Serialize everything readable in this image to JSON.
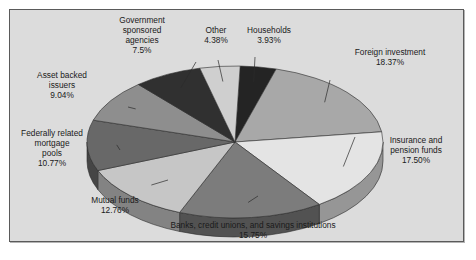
{
  "figure": {
    "background_color": "#ffffff",
    "frame_color": "#dcdcdc",
    "frame_border_color": "#5a5a5a"
  },
  "chart_data": {
    "type": "pie",
    "title": "",
    "subtitle": "",
    "xlabel": "",
    "ylabel": "",
    "grid": false,
    "legend_position": "none",
    "label_format": "name + percent",
    "three_d": true,
    "total_percent": "100.00%",
    "categories": [
      "Households",
      "Foreign investment",
      "Insurance and pension funds",
      "Banks, credit unions, and savings institutions",
      "Mutual funds",
      "Federally related mortgage pools",
      "Asset backed issuers",
      "Government sponsored agencies",
      "Other"
    ],
    "values": [
      3.93,
      18.37,
      17.5,
      15.75,
      12.76,
      10.77,
      9.04,
      7.5,
      4.38
    ],
    "value_labels": [
      "3.93%",
      "18.37%",
      "17.50%",
      "15.75%",
      "12.76%",
      "10.77%",
      "9.04%",
      "7.5%",
      "4.38%"
    ],
    "colors": [
      "#242424",
      "#a8a8a8",
      "#e4e4e4",
      "#7c7c7c",
      "#c6c6c6",
      "#686868",
      "#8e8e8e",
      "#303030",
      "#cfcfcf"
    ],
    "slices": [
      {
        "name": "Households",
        "value": 3.93,
        "value_label": "3.93%",
        "color": "#242424",
        "label_line1": "Households",
        "label_line2": "3.93%"
      },
      {
        "name": "Foreign investment",
        "value": 18.37,
        "value_label": "18.37%",
        "color": "#a8a8a8",
        "label_line1": "Foreign investment",
        "label_line2": "18.37%"
      },
      {
        "name": "Insurance and pension funds",
        "value": 17.5,
        "value_label": "17.50%",
        "color": "#e4e4e4",
        "label_line1": "Insurance and",
        "label_line2": "pension funds",
        "label_line3": "17.50%"
      },
      {
        "name": "Banks, credit unions, and savings institutions",
        "value": 15.75,
        "value_label": "15.75%",
        "color": "#7c7c7c",
        "label_line1": "Banks, credit unions, and savings institutions",
        "label_line2": "15.75%"
      },
      {
        "name": "Mutual funds",
        "value": 12.76,
        "value_label": "12.76%",
        "color": "#c6c6c6",
        "label_line1": "Mutual funds",
        "label_line2": "12.76%"
      },
      {
        "name": "Federally related mortgage pools",
        "value": 10.77,
        "value_label": "10.77%",
        "color": "#686868",
        "label_line1": "Federally related",
        "label_line2": "mortgage",
        "label_line3": "pools",
        "label_line4": "10.77%"
      },
      {
        "name": "Asset backed issuers",
        "value": 9.04,
        "value_label": "9.04%",
        "color": "#8e8e8e",
        "label_line1": "Asset backed",
        "label_line2": "issuers",
        "label_line3": "9.04%"
      },
      {
        "name": "Government sponsored agencies",
        "value": 7.5,
        "value_label": "7.5%",
        "color": "#303030",
        "label_line1": "Government",
        "label_line2": "sponsored",
        "label_line3": "agencies",
        "label_line4": "7.5%"
      },
      {
        "name": "Other",
        "value": 4.38,
        "value_label": "4.38%",
        "color": "#cfcfcf",
        "label_line1": "Other",
        "label_line2": "4.38%"
      }
    ]
  }
}
